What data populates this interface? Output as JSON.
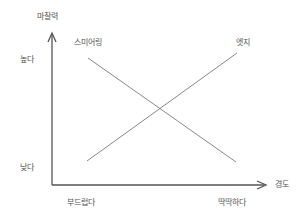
{
  "diagram": {
    "y_axis": {
      "title": "마찰력",
      "high_label": "높다",
      "low_label": "낮다"
    },
    "x_axis": {
      "title": "경도",
      "low_label": "부드럽다",
      "high_label": "딱딱하다"
    },
    "series": [
      {
        "name": "스미어링",
        "trend": "decreasing"
      },
      {
        "name": "엣지",
        "trend": "increasing"
      }
    ],
    "colors": {
      "axis": "#555555",
      "line": "#888888",
      "text": "#555555"
    }
  }
}
